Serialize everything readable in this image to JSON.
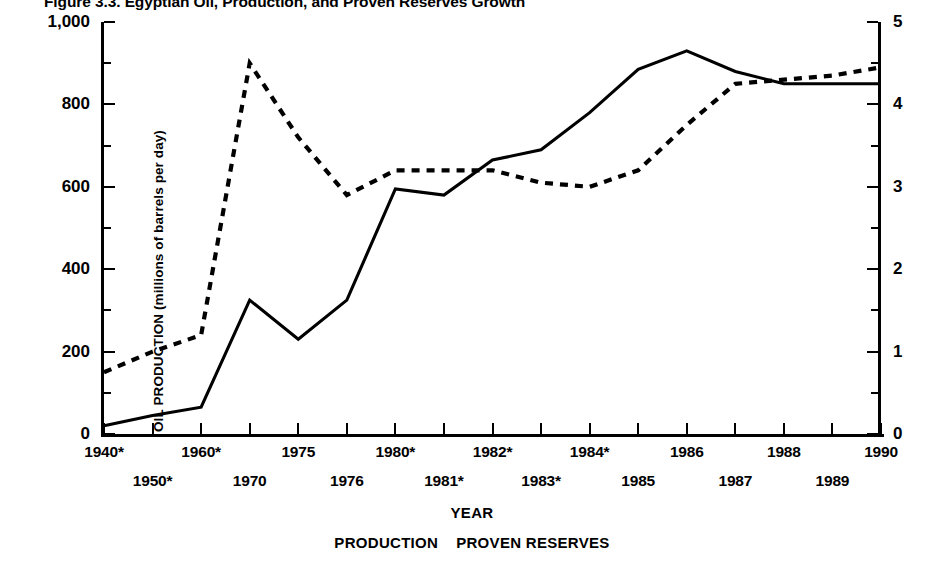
{
  "title": {
    "number": "Figure 3.3.",
    "text": "Egyptian Oil, Production, and Proven Reserves Growth",
    "full": "Figure 3.3.  Egyptian Oil, Production, and Proven Reserves Growth"
  },
  "axes": {
    "x_title": "YEAR",
    "y_left_title": "OIL PRODUCTION (millions of barrels per day)",
    "y_right_title": "PROVEN RESERVES (billions of barrels)",
    "y_left_ticks": [
      "0",
      "200",
      "400",
      "600",
      "800",
      "1,000"
    ],
    "y_right_ticks": [
      "0",
      "1",
      "2",
      "3",
      "4",
      "5"
    ]
  },
  "legend": {
    "production": "PRODUCTION",
    "reserves": "PROVEN RESERVES"
  },
  "chart_data": {
    "type": "line",
    "title": "Figure 3.3.  Egyptian Oil, Production, and Proven Reserves Growth",
    "xlabel": "YEAR",
    "ylabel": "OIL PRODUCTION (millions of barrels per day)",
    "y2label": "PROVEN RESERVES (billions of barrels)",
    "ylim": [
      0,
      1000
    ],
    "y2lim": [
      0,
      5
    ],
    "yticks": [
      0,
      200,
      400,
      600,
      800,
      1000
    ],
    "y2ticks": [
      0,
      1,
      2,
      3,
      4,
      5
    ],
    "minor_ticks": true,
    "grid": false,
    "legend_position": "bottom",
    "categories": [
      "1940*",
      "1950*",
      "1960*",
      "1970",
      "1975",
      "1976",
      "1980*",
      "1981*",
      "1982*",
      "1983*",
      "1984*",
      "1985",
      "1986",
      "1987",
      "1988",
      "1989",
      "1990"
    ],
    "series": [
      {
        "name": "PRODUCTION",
        "axis": "left",
        "style": "solid",
        "units": "millions of barrels per day",
        "values": [
          20,
          45,
          65,
          325,
          230,
          325,
          595,
          580,
          665,
          690,
          780,
          885,
          930,
          880,
          850,
          850,
          850
        ]
      },
      {
        "name": "PROVEN RESERVES",
        "axis": "right",
        "style": "dashed",
        "units": "billions of barrels",
        "values_right_axis": [
          0.75,
          1.0,
          1.2,
          4.5,
          3.6,
          2.9,
          3.2,
          3.2,
          3.2,
          3.05,
          3.0,
          3.2,
          3.75,
          4.25,
          4.3,
          4.35,
          4.45
        ],
        "values_left_scale": [
          150,
          200,
          240,
          900,
          720,
          580,
          640,
          640,
          640,
          610,
          600,
          640,
          750,
          850,
          860,
          870,
          890
        ]
      }
    ]
  }
}
